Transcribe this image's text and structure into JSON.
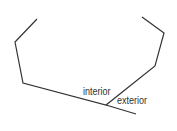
{
  "diagram": {
    "type": "polygon-angles",
    "stroke_color": "#333333",
    "labels": {
      "interior": "interior",
      "exterior": "exterior"
    },
    "polygon_path": [
      [
        37,
        19
      ],
      [
        15,
        42
      ],
      [
        23,
        83
      ],
      [
        106,
        105
      ],
      [
        155,
        66
      ],
      [
        164,
        33
      ],
      [
        142,
        17
      ]
    ],
    "extended_side": {
      "from": [
        106,
        105
      ],
      "to": [
        136,
        114
      ]
    }
  }
}
